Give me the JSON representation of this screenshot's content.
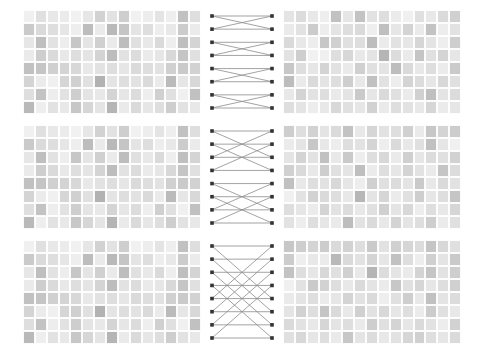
{
  "figure": {
    "title": "",
    "background_color": "#ffffff",
    "panel_count": 6,
    "network_count": 3,
    "stage_labels": [
      "",
      "",
      ""
    ]
  },
  "chart_data": {
    "type": "heatmap",
    "title": "",
    "subtitle": "",
    "xlabel": "",
    "ylabel": "",
    "grid": true,
    "legend_position": "none",
    "colormap": "grays",
    "value_range": [
      0.0,
      1.0
    ],
    "color_stops": [
      "#f7f7f7",
      "#e8e8e8",
      "#d4d4d4",
      "#bfbfbf",
      "#aaaaaa",
      "#979797"
    ],
    "rows": 8,
    "cols": 15,
    "node_marker_color": "#333333",
    "edge_color": "#8c8c8c",
    "stages": [
      {
        "name": "stage-1",
        "butterfly_span": 2,
        "nodes_left": 8,
        "nodes_right": 8,
        "edges": [
          [
            0,
            0
          ],
          [
            0,
            1
          ],
          [
            1,
            0
          ],
          [
            1,
            1
          ],
          [
            2,
            2
          ],
          [
            2,
            3
          ],
          [
            3,
            2
          ],
          [
            3,
            3
          ],
          [
            4,
            4
          ],
          [
            4,
            5
          ],
          [
            5,
            4
          ],
          [
            5,
            5
          ],
          [
            6,
            6
          ],
          [
            6,
            7
          ],
          [
            7,
            6
          ],
          [
            7,
            7
          ]
        ],
        "input": [
          [
            0.1,
            0.28,
            0.2,
            0.16,
            0.08,
            0.22,
            0.42,
            0.26,
            0.46,
            0.08,
            0.14,
            0.24,
            0.12,
            0.58,
            0.3
          ],
          [
            0.5,
            0.34,
            0.3,
            0.22,
            0.12,
            0.62,
            0.18,
            0.66,
            0.54,
            0.24,
            0.3,
            0.14,
            0.2,
            0.48,
            0.16
          ],
          [
            0.22,
            0.6,
            0.26,
            0.14,
            0.52,
            0.24,
            0.44,
            0.18,
            0.62,
            0.28,
            0.2,
            0.34,
            0.12,
            0.6,
            0.4
          ],
          [
            0.18,
            0.46,
            0.34,
            0.2,
            0.3,
            0.24,
            0.4,
            0.62,
            0.26,
            0.32,
            0.18,
            0.22,
            0.36,
            0.54,
            0.28
          ],
          [
            0.58,
            0.54,
            0.44,
            0.4,
            0.36,
            0.2,
            0.26,
            0.3,
            0.22,
            0.34,
            0.3,
            0.26,
            0.44,
            0.5,
            0.42
          ],
          [
            0.4,
            0.16,
            0.1,
            0.38,
            0.44,
            0.28,
            0.72,
            0.24,
            0.3,
            0.26,
            0.34,
            0.18,
            0.64,
            0.22,
            0.36
          ],
          [
            0.3,
            0.56,
            0.14,
            0.26,
            0.46,
            0.24,
            0.2,
            0.4,
            0.22,
            0.32,
            0.12,
            0.44,
            0.28,
            0.1,
            0.58
          ],
          [
            0.66,
            0.12,
            0.26,
            0.2,
            0.52,
            0.38,
            0.24,
            0.7,
            0.18,
            0.34,
            0.22,
            0.3,
            0.46,
            0.26,
            0.2
          ]
        ],
        "output": [
          [
            0.24,
            0.32,
            0.2,
            0.12,
            0.58,
            0.22,
            0.56,
            0.26,
            0.3,
            0.16,
            0.1,
            0.28,
            0.2,
            0.34,
            0.44
          ],
          [
            0.18,
            0.26,
            0.48,
            0.14,
            0.24,
            0.3,
            0.34,
            0.12,
            0.6,
            0.22,
            0.4,
            0.18,
            0.56,
            0.14,
            0.26
          ],
          [
            0.34,
            0.2,
            0.14,
            0.52,
            0.44,
            0.28,
            0.3,
            0.62,
            0.16,
            0.26,
            0.22,
            0.38,
            0.24,
            0.12,
            0.46
          ],
          [
            0.26,
            0.46,
            0.08,
            0.1,
            0.3,
            0.36,
            0.2,
            0.24,
            0.7,
            0.32,
            0.18,
            0.54,
            0.28,
            0.4,
            0.22
          ],
          [
            0.52,
            0.3,
            0.22,
            0.4,
            0.26,
            0.18,
            0.44,
            0.28,
            0.24,
            0.62,
            0.34,
            0.2,
            0.3,
            0.16,
            0.5
          ],
          [
            0.62,
            0.18,
            0.34,
            0.24,
            0.3,
            0.46,
            0.2,
            0.58,
            0.26,
            0.14,
            0.4,
            0.32,
            0.22,
            0.36,
            0.28
          ],
          [
            0.2,
            0.4,
            0.26,
            0.3,
            0.18,
            0.24,
            0.5,
            0.22,
            0.34,
            0.28,
            0.16,
            0.44,
            0.6,
            0.24,
            0.32
          ],
          [
            0.3,
            0.24,
            0.14,
            0.2,
            0.36,
            0.28,
            0.22,
            0.42,
            0.18,
            0.3,
            0.26,
            0.2,
            0.38,
            0.16,
            0.22
          ]
        ]
      },
      {
        "name": "stage-2",
        "butterfly_span": 4,
        "nodes_left": 8,
        "nodes_right": 8,
        "edges": [
          [
            0,
            0
          ],
          [
            0,
            2
          ],
          [
            1,
            1
          ],
          [
            1,
            3
          ],
          [
            2,
            0
          ],
          [
            2,
            2
          ],
          [
            3,
            1
          ],
          [
            3,
            3
          ],
          [
            4,
            4
          ],
          [
            4,
            6
          ],
          [
            5,
            5
          ],
          [
            5,
            7
          ],
          [
            6,
            4
          ],
          [
            6,
            6
          ],
          [
            7,
            5
          ],
          [
            7,
            7
          ]
        ],
        "input": [
          [
            0.1,
            0.28,
            0.2,
            0.16,
            0.08,
            0.22,
            0.42,
            0.26,
            0.46,
            0.08,
            0.14,
            0.24,
            0.12,
            0.58,
            0.3
          ],
          [
            0.5,
            0.34,
            0.3,
            0.22,
            0.12,
            0.62,
            0.18,
            0.66,
            0.54,
            0.24,
            0.3,
            0.14,
            0.2,
            0.48,
            0.16
          ],
          [
            0.22,
            0.6,
            0.26,
            0.14,
            0.52,
            0.24,
            0.44,
            0.18,
            0.62,
            0.28,
            0.2,
            0.34,
            0.12,
            0.6,
            0.4
          ],
          [
            0.18,
            0.46,
            0.34,
            0.2,
            0.3,
            0.24,
            0.4,
            0.62,
            0.26,
            0.32,
            0.18,
            0.22,
            0.36,
            0.54,
            0.28
          ],
          [
            0.58,
            0.54,
            0.44,
            0.4,
            0.36,
            0.2,
            0.26,
            0.3,
            0.22,
            0.34,
            0.3,
            0.26,
            0.44,
            0.5,
            0.42
          ],
          [
            0.4,
            0.16,
            0.1,
            0.38,
            0.44,
            0.28,
            0.72,
            0.24,
            0.3,
            0.26,
            0.34,
            0.18,
            0.64,
            0.22,
            0.36
          ],
          [
            0.3,
            0.56,
            0.14,
            0.26,
            0.46,
            0.24,
            0.2,
            0.4,
            0.22,
            0.32,
            0.12,
            0.44,
            0.28,
            0.1,
            0.58
          ],
          [
            0.66,
            0.12,
            0.26,
            0.2,
            0.52,
            0.38,
            0.24,
            0.7,
            0.18,
            0.34,
            0.22,
            0.3,
            0.46,
            0.26,
            0.2
          ]
        ],
        "output": [
          [
            0.46,
            0.3,
            0.42,
            0.24,
            0.34,
            0.56,
            0.2,
            0.38,
            0.26,
            0.3,
            0.44,
            0.18,
            0.52,
            0.4,
            0.48
          ],
          [
            0.16,
            0.24,
            0.52,
            0.2,
            0.14,
            0.3,
            0.26,
            0.4,
            0.12,
            0.34,
            0.2,
            0.28,
            0.58,
            0.22,
            0.1
          ],
          [
            0.24,
            0.4,
            0.26,
            0.58,
            0.2,
            0.5,
            0.14,
            0.3,
            0.36,
            0.18,
            0.44,
            0.22,
            0.32,
            0.28,
            0.42
          ],
          [
            0.44,
            0.34,
            0.2,
            0.46,
            0.28,
            0.24,
            0.6,
            0.16,
            0.3,
            0.22,
            0.4,
            0.26,
            0.18,
            0.54,
            0.32
          ],
          [
            0.58,
            0.2,
            0.3,
            0.26,
            0.36,
            0.22,
            0.14,
            0.44,
            0.28,
            0.32,
            0.24,
            0.5,
            0.2,
            0.34,
            0.26
          ],
          [
            0.1,
            0.26,
            0.42,
            0.34,
            0.3,
            0.2,
            0.68,
            0.24,
            0.38,
            0.16,
            0.28,
            0.46,
            0.22,
            0.3,
            0.54
          ],
          [
            0.3,
            0.22,
            0.16,
            0.4,
            0.26,
            0.32,
            0.2,
            0.28,
            0.44,
            0.24,
            0.36,
            0.14,
            0.3,
            0.2,
            0.38
          ],
          [
            0.26,
            0.14,
            0.3,
            0.22,
            0.18,
            0.62,
            0.26,
            0.34,
            0.2,
            0.4,
            0.24,
            0.3,
            0.46,
            0.16,
            0.28
          ]
        ]
      },
      {
        "name": "stage-3",
        "butterfly_span": 8,
        "nodes_left": 8,
        "nodes_right": 8,
        "edges": [
          [
            0,
            0
          ],
          [
            0,
            4
          ],
          [
            1,
            1
          ],
          [
            1,
            5
          ],
          [
            2,
            2
          ],
          [
            2,
            6
          ],
          [
            3,
            3
          ],
          [
            3,
            7
          ],
          [
            4,
            0
          ],
          [
            4,
            4
          ],
          [
            5,
            1
          ],
          [
            5,
            5
          ],
          [
            6,
            2
          ],
          [
            6,
            6
          ],
          [
            7,
            3
          ],
          [
            7,
            7
          ]
        ],
        "input": [
          [
            0.1,
            0.28,
            0.2,
            0.16,
            0.08,
            0.22,
            0.42,
            0.26,
            0.46,
            0.08,
            0.14,
            0.24,
            0.12,
            0.58,
            0.3
          ],
          [
            0.5,
            0.34,
            0.3,
            0.22,
            0.12,
            0.62,
            0.18,
            0.66,
            0.54,
            0.24,
            0.3,
            0.14,
            0.2,
            0.48,
            0.16
          ],
          [
            0.22,
            0.6,
            0.26,
            0.14,
            0.52,
            0.24,
            0.44,
            0.18,
            0.62,
            0.28,
            0.2,
            0.34,
            0.12,
            0.6,
            0.4
          ],
          [
            0.18,
            0.46,
            0.34,
            0.2,
            0.3,
            0.24,
            0.4,
            0.62,
            0.26,
            0.32,
            0.18,
            0.22,
            0.36,
            0.54,
            0.28
          ],
          [
            0.58,
            0.54,
            0.44,
            0.4,
            0.36,
            0.2,
            0.26,
            0.3,
            0.22,
            0.34,
            0.3,
            0.26,
            0.44,
            0.5,
            0.42
          ],
          [
            0.4,
            0.16,
            0.1,
            0.38,
            0.44,
            0.28,
            0.72,
            0.24,
            0.3,
            0.26,
            0.34,
            0.18,
            0.64,
            0.22,
            0.36
          ],
          [
            0.3,
            0.56,
            0.14,
            0.26,
            0.46,
            0.24,
            0.2,
            0.4,
            0.22,
            0.32,
            0.12,
            0.44,
            0.28,
            0.1,
            0.58
          ],
          [
            0.66,
            0.12,
            0.26,
            0.2,
            0.52,
            0.38,
            0.24,
            0.7,
            0.18,
            0.34,
            0.22,
            0.3,
            0.46,
            0.26,
            0.2
          ]
        ],
        "output": [
          [
            0.52,
            0.46,
            0.4,
            0.48,
            0.34,
            0.42,
            0.3,
            0.5,
            0.26,
            0.44,
            0.38,
            0.32,
            0.54,
            0.36,
            0.28
          ],
          [
            0.48,
            0.12,
            0.2,
            0.16,
            0.66,
            0.34,
            0.26,
            0.4,
            0.22,
            0.58,
            0.3,
            0.14,
            0.44,
            0.24,
            0.5
          ],
          [
            0.56,
            0.3,
            0.22,
            0.36,
            0.28,
            0.44,
            0.2,
            0.7,
            0.32,
            0.24,
            0.18,
            0.4,
            0.54,
            0.26,
            0.46
          ],
          [
            0.1,
            0.26,
            0.5,
            0.42,
            0.3,
            0.2,
            0.34,
            0.24,
            0.16,
            0.52,
            0.28,
            0.38,
            0.22,
            0.3,
            0.44
          ],
          [
            0.18,
            0.24,
            0.3,
            0.16,
            0.22,
            0.4,
            0.26,
            0.34,
            0.12,
            0.28,
            0.46,
            0.2,
            0.58,
            0.24,
            0.32
          ],
          [
            0.24,
            0.42,
            0.3,
            0.54,
            0.34,
            0.2,
            0.44,
            0.26,
            0.36,
            0.22,
            0.3,
            0.16,
            0.48,
            0.28,
            0.2
          ],
          [
            0.34,
            0.26,
            0.2,
            0.38,
            0.24,
            0.3,
            0.18,
            0.46,
            0.28,
            0.4,
            0.22,
            0.34,
            0.26,
            0.14,
            0.42
          ],
          [
            0.28,
            0.36,
            0.22,
            0.3,
            0.18,
            0.52,
            0.24,
            0.32,
            0.2,
            0.26,
            0.38,
            0.44,
            0.3,
            0.22,
            0.34
          ]
        ]
      }
    ]
  }
}
